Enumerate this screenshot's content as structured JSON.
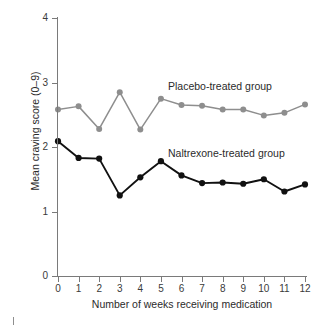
{
  "chart_data": {
    "type": "line",
    "title": "",
    "xlabel": "Number of weeks receiving medication",
    "ylabel": "Mean craving score (0–9)",
    "x": [
      0,
      1,
      2,
      3,
      4,
      5,
      6,
      7,
      8,
      9,
      10,
      11,
      12
    ],
    "categories": [
      "0",
      "1",
      "2",
      "3",
      "4",
      "5",
      "6",
      "7",
      "8",
      "9",
      "10",
      "11",
      "12"
    ],
    "xlim": [
      0,
      12
    ],
    "ylim": [
      0,
      4
    ],
    "xticks": [
      "0",
      "1",
      "2",
      "3",
      "4",
      "5",
      "6",
      "7",
      "8",
      "9",
      "10",
      "11",
      "12"
    ],
    "yticks": [
      "0",
      "1",
      "2",
      "3",
      "4"
    ],
    "grid": false,
    "legend_position": "inline-annotation",
    "series": [
      {
        "name": "Placebo-treated group",
        "color": "#8e8e8e",
        "marker": "circle",
        "values": [
          2.58,
          2.63,
          2.28,
          2.85,
          2.27,
          2.75,
          2.65,
          2.64,
          2.58,
          2.58,
          2.49,
          2.53,
          2.66
        ]
      },
      {
        "name": "Naltrexone-treated group",
        "color": "#111111",
        "marker": "circle",
        "values": [
          2.09,
          1.83,
          1.82,
          1.25,
          1.53,
          1.78,
          1.56,
          1.44,
          1.45,
          1.43,
          1.5,
          1.31,
          1.42
        ]
      }
    ],
    "annotations": [
      {
        "text": "Placebo-treated group",
        "x": 5.4,
        "y": 2.95
      },
      {
        "text": "Naltrexone-treated group",
        "x": 5.4,
        "y": 1.97
      }
    ]
  },
  "axes": {
    "y_title": "Mean craving score (0–9)",
    "x_title": "Number of weeks receiving medication"
  }
}
